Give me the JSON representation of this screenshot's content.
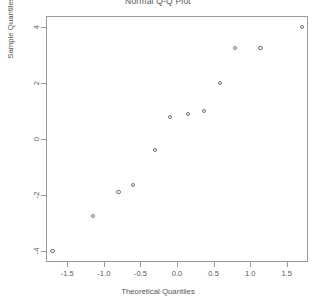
{
  "chart_data": {
    "type": "scatter",
    "title": "Normal Q-Q Plot",
    "xlabel": "Theoretical Quantiles",
    "ylabel": "Sample Quantiles",
    "xlim": [
      -1.79,
      1.79
    ],
    "ylim": [
      -4.4,
      4.4
    ],
    "xticks": [
      -1.5,
      -1.0,
      -0.5,
      0.0,
      0.5,
      1.0,
      1.5
    ],
    "xticklabels": [
      "-1.5",
      "-1.0",
      "-0.5",
      "0.0",
      "0.5",
      "1.0",
      "1.5"
    ],
    "yticks": [
      -4,
      -2,
      0,
      2,
      4
    ],
    "yticklabels": [
      "-4",
      "-2",
      "0",
      "2",
      "4"
    ],
    "grid": false,
    "legend": null,
    "marker": "open-circle",
    "marker_color": "#6f6f6f",
    "n_points": 12,
    "x": [
      -1.7,
      -1.15,
      -0.8,
      -0.6,
      -0.3,
      -0.1,
      0.15,
      0.37,
      0.59,
      0.79,
      1.14,
      1.71
    ],
    "y": [
      -4.0,
      -2.75,
      -1.9,
      -1.65,
      -0.4,
      0.8,
      0.9,
      1.0,
      2.0,
      3.25,
      3.25,
      4.0
    ],
    "points": [
      {
        "x": -1.7,
        "y": -4.0
      },
      {
        "x": -1.15,
        "y": -2.75
      },
      {
        "x": -0.8,
        "y": -1.9
      },
      {
        "x": -0.6,
        "y": -1.65
      },
      {
        "x": -0.3,
        "y": -0.4
      },
      {
        "x": -0.1,
        "y": 0.8
      },
      {
        "x": 0.15,
        "y": 0.9
      },
      {
        "x": 0.37,
        "y": 1.0
      },
      {
        "x": 0.59,
        "y": 2.0
      },
      {
        "x": 0.79,
        "y": 3.25
      },
      {
        "x": 1.14,
        "y": 3.25
      },
      {
        "x": 1.71,
        "y": 4.0
      }
    ]
  }
}
